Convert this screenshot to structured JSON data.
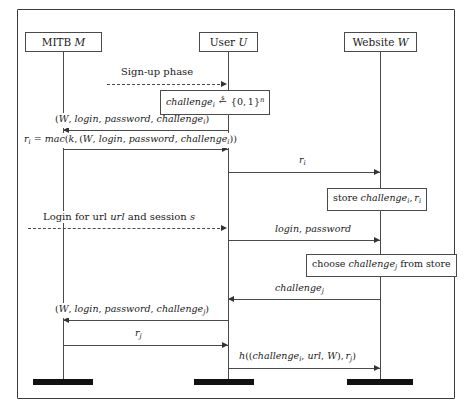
{
  "diagram": {
    "type": "sequence-diagram",
    "background_color": "#ffffff",
    "line_color": "#4a4a4a",
    "text_color": "#1a1a1a",
    "actors": [
      {
        "id": "mitb",
        "label": "MITB M",
        "name": "MITB",
        "symbol": "M"
      },
      {
        "id": "user",
        "label": "User U",
        "name": "User",
        "symbol": "U"
      },
      {
        "id": "website",
        "label": "Website W",
        "name": "Website",
        "symbol": "W"
      }
    ],
    "phases": [
      {
        "id": "signup",
        "label": "Sign-up phase"
      },
      {
        "id": "login",
        "label": "Login for url url and session s"
      }
    ],
    "notes": [
      {
        "id": "challenge-gen",
        "label": "challenge_i <-$ {0,1}^n",
        "actor": "user"
      },
      {
        "id": "store-note",
        "label": "store challenge_i, r_i",
        "actor": "website"
      },
      {
        "id": "choose-note",
        "label": "choose challenge_j from store",
        "actor": "website"
      }
    ],
    "formulas": [
      {
        "id": "mac-formula",
        "label": "r_i = mac(k, (W, login, password, challenge_i))"
      }
    ],
    "messages": [
      {
        "id": "m1",
        "label": "(W, login, password, challenge_i)",
        "from": "user",
        "to": "mitb",
        "direction": "left"
      },
      {
        "id": "m2",
        "label": "r_i",
        "from": "mitb",
        "to": "user",
        "direction": "right"
      },
      {
        "id": "m3",
        "label": "r_i",
        "from": "user",
        "to": "website",
        "direction": "right"
      },
      {
        "id": "m4",
        "label": "login, password",
        "from": "user",
        "to": "website",
        "direction": "right"
      },
      {
        "id": "m5",
        "label": "challenge_j",
        "from": "website",
        "to": "user",
        "direction": "left"
      },
      {
        "id": "m6",
        "label": "(W, login, password, challenge_j)",
        "from": "user",
        "to": "mitb",
        "direction": "left"
      },
      {
        "id": "m7",
        "label": "r_j",
        "from": "mitb",
        "to": "user",
        "direction": "right"
      },
      {
        "id": "m8",
        "label": "h((challenge_i, url, W), r_j)",
        "from": "user",
        "to": "website",
        "direction": "right"
      }
    ]
  }
}
